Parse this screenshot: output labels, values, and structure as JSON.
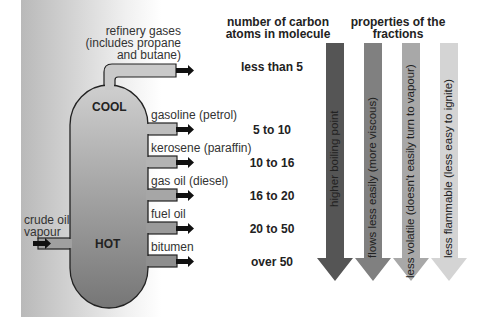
{
  "column": {
    "cool_label": "COOL",
    "hot_label": "HOT",
    "input_label_line1": "crude oil",
    "input_label_line2": "vapour"
  },
  "fractions": [
    {
      "name_line1": "refinery gases",
      "name_line2": "(includes propane",
      "name_line3": "and butane)",
      "carbon_atoms": "less than 5"
    },
    {
      "name": "gasoline (petrol)",
      "carbon_atoms": "5 to 10"
    },
    {
      "name": "kerosene (paraffin)",
      "carbon_atoms": "10 to 16"
    },
    {
      "name": "gas oil (diesel)",
      "carbon_atoms": "16 to 20"
    },
    {
      "name": "fuel oil",
      "carbon_atoms": "20 to 50"
    },
    {
      "name": "bitumen",
      "carbon_atoms": "over 50"
    }
  ],
  "headers": {
    "carbon_line1": "number of carbon",
    "carbon_line2": "atoms in molecule",
    "properties_line1": "properties of the",
    "properties_line2": "fractions"
  },
  "properties": [
    {
      "label": "higher boiling point",
      "color": "#555555"
    },
    {
      "label": "flows less easily (more viscous)",
      "color": "#808080"
    },
    {
      "label": "less volatile (doesn't easily turn to vapour)",
      "color": "#a8a8a8"
    },
    {
      "label": "less flammable (less easy to ignite)",
      "color": "#d4d4d4"
    }
  ],
  "colors": {
    "column_top": "#c8c8c8",
    "column_bottom": "#7a7a7a",
    "outline": "#222222"
  }
}
